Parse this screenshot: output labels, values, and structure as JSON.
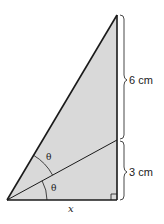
{
  "diagram": {
    "type": "right-triangle-angle-bisector",
    "fill_color": "#d9d9d9",
    "stroke_color": "#1a1a1a",
    "vertices": {
      "top": [
        117,
        15
      ],
      "bottom_left": [
        7,
        200
      ],
      "right_angle": [
        117,
        200
      ],
      "bisector_foot": [
        117,
        140
      ]
    },
    "labels": {
      "upper_segment": "6 cm",
      "lower_segment": "3 cm",
      "base": "x",
      "angle_upper": "θ",
      "angle_lower": "θ"
    }
  }
}
